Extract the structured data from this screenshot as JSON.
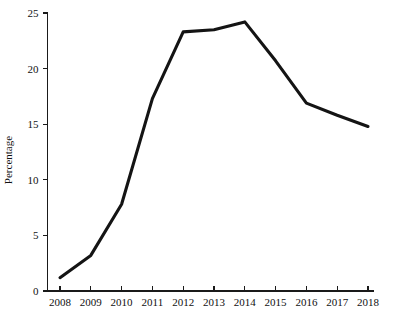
{
  "chart_data": {
    "type": "line",
    "title": "",
    "xlabel": "",
    "ylabel": "Percentage",
    "categories": [
      "2008",
      "2009",
      "2010",
      "2011",
      "2012",
      "2013",
      "2014",
      "2015",
      "2016",
      "2017",
      "2018"
    ],
    "x": [
      2008,
      2009,
      2010,
      2011,
      2012,
      2013,
      2014,
      2015,
      2016,
      2017,
      2018
    ],
    "values": [
      1.2,
      3.2,
      7.8,
      17.3,
      23.3,
      23.5,
      24.2,
      20.7,
      16.9,
      15.8,
      14.8
    ],
    "series": [
      {
        "name": "Percentage",
        "values": [
          1.2,
          3.2,
          7.8,
          17.3,
          23.3,
          23.5,
          24.2,
          20.7,
          16.9,
          15.8,
          14.8
        ]
      }
    ],
    "xlim": [
      2008,
      2018
    ],
    "ylim": [
      0,
      25
    ],
    "yticks": [
      0,
      5,
      10,
      15,
      20,
      25
    ],
    "ytick_labels": [
      "0",
      "5",
      "10",
      "15",
      "20",
      "25"
    ],
    "xticks": [
      2008,
      2009,
      2010,
      2011,
      2012,
      2013,
      2014,
      2015,
      2016,
      2017,
      2018
    ],
    "grid": false,
    "legend": false,
    "legend_position": "none",
    "line_color": "#141414",
    "annotations": []
  },
  "axes": {
    "y_axis_title": "Percentage"
  }
}
